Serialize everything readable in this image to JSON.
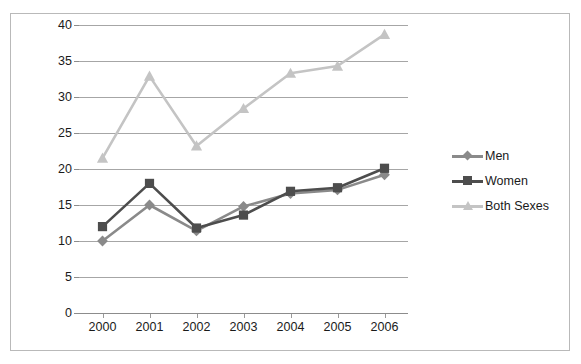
{
  "chart_data": {
    "type": "line",
    "title": "",
    "subtitle": "",
    "xlabel": "",
    "ylabel": "Thousands",
    "categories": [
      "2000",
      "2001",
      "2002",
      "2003",
      "2004",
      "2005",
      "2006"
    ],
    "x": [
      2000,
      2001,
      2002,
      2003,
      2004,
      2005,
      2006
    ],
    "ylim": [
      0,
      40
    ],
    "ytick_labels": [
      "0",
      "5",
      "10",
      "15",
      "20",
      "25",
      "30",
      "35",
      "40"
    ],
    "ytick_values": [
      0,
      5,
      10,
      15,
      20,
      25,
      30,
      35,
      40
    ],
    "grid": "horizontal",
    "legend_position": "right",
    "series": [
      {
        "name": "Men",
        "color": "#8a8a8a",
        "marker": "diamond",
        "values": [
          10.0,
          15.0,
          11.4,
          14.8,
          16.6,
          17.1,
          19.2
        ]
      },
      {
        "name": "Women",
        "color": "#4d4d4d",
        "marker": "square",
        "values": [
          12.0,
          18.0,
          11.8,
          13.6,
          16.9,
          17.4,
          20.1
        ]
      },
      {
        "name": "Both Sexes",
        "color": "#c4c4c4",
        "marker": "triangle",
        "values": [
          21.5,
          32.9,
          23.2,
          28.4,
          33.3,
          34.3,
          38.7
        ]
      }
    ]
  },
  "legend": {
    "items": [
      {
        "label": "Men"
      },
      {
        "label": "Women"
      },
      {
        "label": "Both Sexes"
      }
    ]
  },
  "axis": {
    "y_title": "Thousands"
  },
  "colors": {
    "men": "#8a8a8a",
    "women": "#4d4d4d",
    "both_sexes": "#c4c4c4",
    "gridline": "#a6a6a6",
    "axis": "#8c8c8c",
    "border": "#b9b9b9",
    "text": "#1a1a1a",
    "background": "#ffffff"
  }
}
